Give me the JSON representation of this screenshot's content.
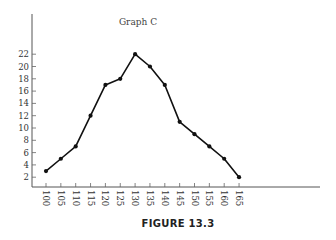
{
  "chart_data": {
    "type": "line",
    "title": "Graph C",
    "xlabel": "",
    "ylabel": "",
    "x": [
      100,
      105,
      110,
      115,
      120,
      125,
      130,
      135,
      140,
      145,
      150,
      155,
      160,
      165
    ],
    "series": [
      {
        "name": "Graph C",
        "values": [
          3,
          5,
          7,
          12,
          17,
          18,
          22,
          20,
          17,
          11,
          9,
          7,
          5,
          2
        ]
      }
    ],
    "yticks": [
      2,
      4,
      6,
      8,
      10,
      12,
      14,
      16,
      18,
      20,
      22
    ],
    "xticks": [
      100,
      105,
      110,
      115,
      120,
      125,
      130,
      135,
      140,
      145,
      150,
      155,
      160,
      165
    ],
    "ylim": [
      0,
      22
    ],
    "grid": false,
    "legend": "none",
    "markers": true
  },
  "caption": "FIGURE 13.3",
  "colors": {
    "line": "#111111",
    "axis": "#555555",
    "text": "#333333"
  }
}
